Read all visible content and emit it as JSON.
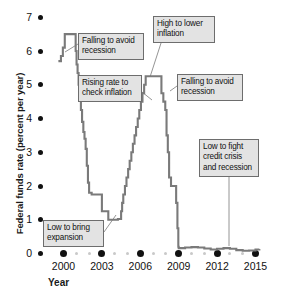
{
  "chart_data": {
    "type": "line",
    "title": "",
    "xlabel": "Year",
    "ylabel": "Federal funds rate (percent per year)",
    "xlim": [
      1999.6,
      2015.4
    ],
    "ylim": [
      0,
      7
    ],
    "grid": false,
    "legend": "none",
    "y_ticks": [
      0,
      1,
      2,
      3,
      4,
      5,
      6,
      7
    ],
    "y_tick_labels": [
      "0",
      "1",
      "2",
      "3",
      "4",
      "5",
      "6",
      "7"
    ],
    "x_ticks": [
      2000,
      2003,
      2006,
      2009,
      2012,
      2015
    ],
    "x_tick_labels": [
      "2000",
      "2003",
      "2006",
      "2009",
      "2012",
      "2015"
    ],
    "x_minor_ticks": [
      2001,
      2002,
      2004,
      2005,
      2007,
      2008,
      2010,
      2011,
      2013,
      2014
    ],
    "series": [
      {
        "name": "Federal funds rate",
        "line_color": "#7a7a7a",
        "x": [
          1999.6,
          1999.8,
          1999.95,
          2000.1,
          2000.25,
          2000.4,
          2000.55,
          2000.95,
          2001.02,
          2001.1,
          2001.18,
          2001.27,
          2001.36,
          2001.45,
          2001.55,
          2001.64,
          2001.73,
          2001.82,
          2001.91,
          2002.0,
          2002.2,
          2002.9,
          2003.0,
          2003.3,
          2003.5,
          2003.75,
          2004.0,
          2004.25,
          2004.5,
          2004.58,
          2004.67,
          2004.8,
          2004.92,
          2005.05,
          2005.17,
          2005.3,
          2005.42,
          2005.55,
          2005.67,
          2005.8,
          2005.92,
          2006.05,
          2006.17,
          2006.3,
          2006.42,
          2006.55,
          2007.5,
          2007.65,
          2007.8,
          2007.95,
          2008.05,
          2008.15,
          2008.25,
          2008.4,
          2008.6,
          2008.8,
          2008.9,
          2008.97,
          2009.0,
          2009.5,
          2010.0,
          2010.5,
          2011.0,
          2011.5,
          2012.0,
          2012.5,
          2013.0,
          2013.5,
          2014.0,
          2014.5,
          2015.0,
          2015.3
        ],
        "y": [
          5.7,
          5.85,
          6.1,
          6.5,
          6.5,
          6.5,
          6.5,
          6.0,
          5.6,
          5.35,
          5.0,
          4.6,
          4.25,
          3.9,
          3.6,
          3.4,
          3.1,
          2.6,
          2.1,
          1.8,
          1.75,
          1.75,
          1.25,
          1.25,
          1.0,
          1.0,
          1.0,
          1.02,
          1.25,
          1.5,
          1.75,
          2.0,
          2.25,
          2.5,
          2.75,
          3.0,
          3.25,
          3.5,
          3.75,
          4.0,
          4.25,
          4.5,
          4.75,
          5.0,
          5.25,
          5.25,
          5.25,
          4.75,
          4.5,
          4.25,
          3.5,
          3.0,
          2.25,
          2.0,
          2.0,
          1.5,
          0.75,
          0.2,
          0.16,
          0.18,
          0.19,
          0.18,
          0.15,
          0.12,
          0.14,
          0.16,
          0.14,
          0.1,
          0.08,
          0.09,
          0.12,
          0.13
        ]
      }
    ],
    "annotations": [
      {
        "id": "falling-avoid-recession-1",
        "lines": [
          "Falling to avoid",
          "recession"
        ],
        "box": {
          "left": 78,
          "top": 33,
          "width": 66,
          "height": 24
        },
        "leader": {
          "x1": 78,
          "y1": 44,
          "x2": 65,
          "y2": 52
        }
      },
      {
        "id": "rising-check-inflation",
        "lines": [
          "Rising rate to",
          "check inflation"
        ],
        "box": {
          "left": 78,
          "top": 75,
          "width": 64,
          "height": 24
        },
        "leader": {
          "x1": 142,
          "y1": 92,
          "x2": 152,
          "y2": 100
        }
      },
      {
        "id": "high-to-lower-inflation",
        "lines": [
          "High to lower",
          "inflation"
        ],
        "box": {
          "left": 153,
          "top": 16,
          "width": 62,
          "height": 24
        },
        "leader": {
          "x1": 162,
          "y1": 40,
          "x2": 150,
          "y2": 77
        }
      },
      {
        "id": "falling-avoid-recession-2",
        "lines": [
          "Falling to avoid",
          "recession"
        ],
        "box": {
          "left": 177,
          "top": 74,
          "width": 66,
          "height": 24
        },
        "leader": {
          "x1": 177,
          "y1": 86,
          "x2": 170,
          "y2": 91
        }
      },
      {
        "id": "low-fight-credit-crisis",
        "lines": [
          "Low to fight",
          "credit crisis",
          "and recession"
        ],
        "box": {
          "left": 199,
          "top": 139,
          "width": 60,
          "height": 35
        },
        "leader": {
          "x1": 229,
          "y1": 174,
          "x2": 229,
          "y2": 246
        }
      },
      {
        "id": "low-to-bring-expansion",
        "lines": [
          "Low to bring",
          "expansion"
        ],
        "box": {
          "left": 43,
          "top": 220,
          "width": 61,
          "height": 24
        },
        "leader": {
          "x1": 104,
          "y1": 232,
          "x2": 116,
          "y2": 215
        }
      }
    ]
  },
  "axes": {
    "y_label": "Federal funds rate (percent per year)",
    "x_label": "Year"
  }
}
